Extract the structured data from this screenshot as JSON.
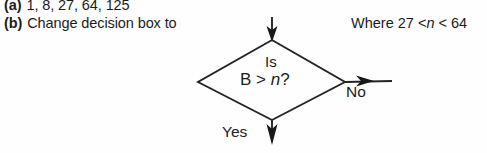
{
  "answers": {
    "part_a": {
      "label": "(a)",
      "text": "1, 8, 27, 64, 125"
    },
    "part_b": {
      "label": "(b)",
      "text": "Change decision box to"
    }
  },
  "where_note": {
    "prefix": "Where 27 <",
    "variable": "n",
    "suffix": "< 64",
    "full": "Where 27 < n < 64"
  },
  "flowchart": {
    "decision": {
      "line1": "Is",
      "line2_prefix": "B >",
      "line2_variable": "n",
      "line2_suffix": "?",
      "full_text": "Is B > n?"
    },
    "branches": {
      "no_label": "No",
      "yes_label": "Yes"
    },
    "connectors": {
      "input_arrow": "arrow-down-into-decision",
      "no_arrow": "arrow-right-out-of-decision",
      "yes_arrow": "arrow-down-out-of-decision"
    }
  },
  "colors": {
    "ink": "#1c1c1c",
    "stroke": "#242424",
    "background": "#fefefe"
  }
}
